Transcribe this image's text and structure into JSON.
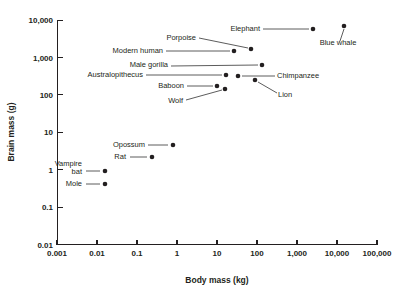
{
  "chart_data": {
    "type": "scatter",
    "title": "",
    "xlabel": "Body mass (kg)",
    "ylabel": "Brain mass (g)",
    "xscale": "log",
    "yscale": "log",
    "xlim": [
      0.001,
      100000
    ],
    "ylim": [
      0.01,
      10000
    ],
    "xticks": [
      "0.001",
      "0.01",
      "0.1",
      "1",
      "10",
      "100",
      "1,000",
      "10,000",
      "100,000"
    ],
    "xtick_values": [
      0.001,
      0.01,
      0.1,
      1,
      10,
      100,
      1000,
      10000,
      100000
    ],
    "yticks": [
      "0.01",
      "0.1",
      "1",
      "10",
      "100",
      "1,000",
      "10,000"
    ],
    "ytick_values": [
      0.01,
      0.1,
      1,
      10,
      100,
      1000,
      10000
    ],
    "grid": false,
    "legend": "none",
    "marker_color": "#231f20",
    "points": [
      {
        "label": "Mole",
        "x": 0.018,
        "y": 0.37,
        "px": 105,
        "py": 184,
        "lx": 82,
        "ly": 186,
        "anchor": "end",
        "leader": [
          86,
          184,
          100,
          184
        ]
      },
      {
        "label": "Vampire bat",
        "x": 0.018,
        "y": 0.95,
        "px": 105,
        "py": 171,
        "lx": 82,
        "ly": 166,
        "anchor": "end",
        "leader": [
          86,
          171,
          100,
          171
        ],
        "line2": "bat",
        "line2_y": 174
      },
      {
        "label": "Rat",
        "x": 0.27,
        "y": 2.3,
        "px": 152,
        "py": 157,
        "lx": 126,
        "ly": 159,
        "anchor": "end",
        "leader": [
          130,
          157,
          147,
          157
        ]
      },
      {
        "label": "Opossum",
        "x": 1.1,
        "y": 4.9,
        "px": 173,
        "py": 145,
        "lx": 145,
        "ly": 147,
        "anchor": "end",
        "leader": [
          148,
          145,
          168,
          145
        ]
      },
      {
        "label": "Wolf",
        "x": 31,
        "y": 150,
        "px": 225,
        "py": 89,
        "lx": 183,
        "ly": 103,
        "anchor": "end",
        "leader": [
          186,
          100,
          222,
          90
        ]
      },
      {
        "label": "Baboon",
        "x": 18,
        "y": 180,
        "px": 217,
        "py": 86,
        "lx": 184,
        "ly": 88,
        "anchor": "end",
        "leader": [
          187,
          86,
          213,
          86
        ]
      },
      {
        "label": "Lion",
        "x": 225,
        "y": 260,
        "px": 255,
        "py": 80,
        "lx": 278,
        "ly": 97,
        "anchor": "start",
        "leader": [
          258,
          82,
          277,
          93
        ]
      },
      {
        "label": "Australopithecus",
        "x": 36,
        "y": 400,
        "px": 226,
        "py": 75,
        "lx": 143,
        "ly": 77,
        "anchor": "end",
        "leader": [
          146,
          75,
          222,
          75
        ]
      },
      {
        "label": "Chimpanzee",
        "x": 52,
        "y": 380,
        "px": 238,
        "py": 76,
        "lx": 277,
        "ly": 78,
        "anchor": "start",
        "leader": [
          242,
          76,
          275,
          76
        ]
      },
      {
        "label": "Male gorilla",
        "x": 207,
        "y": 550,
        "px": 262,
        "py": 65,
        "lx": 168,
        "ly": 67,
        "anchor": "end",
        "leader": [
          171,
          66,
          258,
          65
        ]
      },
      {
        "label": "Modern human",
        "x": 62,
        "y": 1350,
        "px": 234,
        "py": 51,
        "lx": 163,
        "ly": 53,
        "anchor": "end",
        "leader": [
          166,
          51,
          230,
          51
        ]
      },
      {
        "label": "Porpoise",
        "x": 140,
        "y": 1700,
        "px": 251,
        "py": 49,
        "lx": 196,
        "ly": 40,
        "anchor": "end",
        "leader": [
          199,
          38,
          248,
          48
        ]
      },
      {
        "label": "Elephant",
        "x": 6500,
        "y": 5000,
        "px": 313,
        "py": 29,
        "lx": 260,
        "ly": 31,
        "anchor": "end",
        "leader": [
          263,
          29,
          309,
          29
        ]
      },
      {
        "label": "Blue whale",
        "x": 50000,
        "y": 6500,
        "px": 344,
        "py": 26,
        "lx": 338,
        "ly": 45,
        "anchor": "middle",
        "leader": [
          340,
          41,
          344,
          29
        ]
      }
    ]
  },
  "axes": {
    "x_title": "Body mass (kg)",
    "y_title": "Brain mass (g)"
  }
}
